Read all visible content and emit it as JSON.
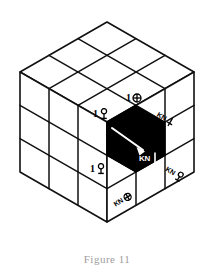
{
  "figure": {
    "caption": "Figure 11",
    "background_color": "#ffffff",
    "ink_color": "#000000",
    "highlight_cell_color": "#000000",
    "grid_divisions": 3
  },
  "faces": {
    "top": {
      "name": "top-face",
      "rows": 3,
      "cols": 3
    },
    "left": {
      "name": "left-face",
      "rows": 3,
      "cols": 3
    },
    "right": {
      "name": "right-face",
      "rows": 3,
      "cols": 3
    }
  },
  "highlight": {
    "name": "black-unit-cell",
    "fill": "#000000",
    "leader_line_color": "#ffffff",
    "leader_label": "KN"
  },
  "labels": [
    {
      "id": "label-top-center",
      "prefix": "1",
      "glyph": "circled-cross-icon",
      "glyph_name": "circled-cross-icon",
      "text": "1",
      "on_dark": false
    },
    {
      "id": "label-top-left",
      "prefix": "1",
      "glyph": "goblet-icon",
      "glyph_name": "goblet-icon",
      "text": "1",
      "on_dark": false
    },
    {
      "id": "label-right-upper",
      "prefix": "KN",
      "glyph": "cross-icon",
      "glyph_name": "cross-icon",
      "text": "KN",
      "on_dark": false
    },
    {
      "id": "label-center-dark",
      "prefix": "KN",
      "glyph": "vertical-bar-icon",
      "glyph_name": "vertical-bar-icon",
      "text": "KN",
      "on_dark": true
    },
    {
      "id": "label-right-lower",
      "prefix": "KN",
      "glyph": "goblet-icon",
      "glyph_name": "goblet-icon",
      "text": "KN",
      "on_dark": false
    },
    {
      "id": "label-left-lower",
      "prefix": "1",
      "glyph": "goblet-icon",
      "glyph_name": "goblet-icon",
      "text": "1",
      "on_dark": false
    },
    {
      "id": "label-bottom",
      "prefix": "KN",
      "glyph": "circled-cross-icon",
      "glyph_name": "circled-cross-icon",
      "text": "KN",
      "on_dark": false
    }
  ]
}
